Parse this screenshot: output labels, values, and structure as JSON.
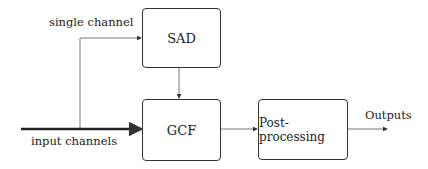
{
  "diagram": {
    "blocks": {
      "sad": "SAD",
      "gcf": "GCF",
      "post": "Post-processing"
    },
    "labels": {
      "single_channel": "single channel",
      "input_channels": "input channels",
      "outputs": "Outputs"
    },
    "colors": {
      "line": "#333333",
      "background": "#ffffff"
    }
  }
}
